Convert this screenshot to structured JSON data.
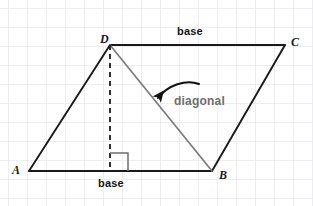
{
  "figure": {
    "width": 313,
    "height": 206,
    "background_color": "#ffffff",
    "grid": {
      "visible": true,
      "color": "#e8e8ec",
      "spacing_px": 19,
      "origin_x": 8,
      "origin_y": 8,
      "line_width": 1.4
    },
    "colors": {
      "shape_stroke": "#1a1a1a",
      "diagonal_stroke": "#7b7b7b",
      "dashed_stroke": "#1a1a1a",
      "right_angle_stroke": "#6e6e6e",
      "arrow_stroke": "#111111",
      "label_text": "#1a1a1a",
      "annotation_text": "#141414",
      "diagonal_text": "#6e6e6e"
    }
  },
  "vertices": [
    {
      "id": "A",
      "label": "A",
      "x": 29,
      "y": 171
    },
    {
      "id": "B",
      "label": "B",
      "x": 212,
      "y": 171
    },
    {
      "id": "C",
      "label": "C",
      "x": 285,
      "y": 45
    },
    {
      "id": "D",
      "label": "D",
      "x": 110,
      "y": 45
    }
  ],
  "edges": [
    {
      "id": "AB",
      "from": "A",
      "to": "B",
      "style": "solid",
      "role": "base-bottom"
    },
    {
      "id": "BC",
      "from": "B",
      "to": "C",
      "style": "solid",
      "role": "side-right"
    },
    {
      "id": "DC",
      "from": "D",
      "to": "C",
      "style": "solid",
      "role": "base-top"
    },
    {
      "id": "AD",
      "from": "A",
      "to": "D",
      "style": "solid",
      "role": "side-left"
    },
    {
      "id": "DB",
      "from": "D",
      "to": "B",
      "style": "solid",
      "role": "diagonal"
    }
  ],
  "altitude": {
    "label": "height",
    "style": "dashed",
    "from_x": 110,
    "from_y": 45,
    "to_x": 110,
    "to_y": 171,
    "dash_pattern": "5,4"
  },
  "right_angle": {
    "size_px": 18,
    "corner_x": 110,
    "corner_y": 171,
    "opens": "right"
  },
  "annotations": {
    "base_top": "base",
    "base_bottom": "base",
    "diagonal": "diagonal"
  },
  "callout_arrow": {
    "name": "diagonal-callout-arrow",
    "start_x": 199,
    "start_y": 84,
    "end_x": 158,
    "end_y": 98,
    "curved": true,
    "arrowhead_at": "end"
  }
}
